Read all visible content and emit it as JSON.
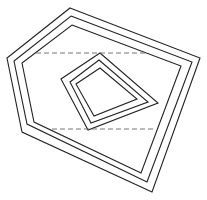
{
  "figure": {
    "outer_contour_count": 3,
    "inner_contour_count": 3,
    "dashed_line_count": 2,
    "colors": {
      "line": "#222222",
      "dashed": "#666666",
      "background": "#ffffff"
    }
  }
}
